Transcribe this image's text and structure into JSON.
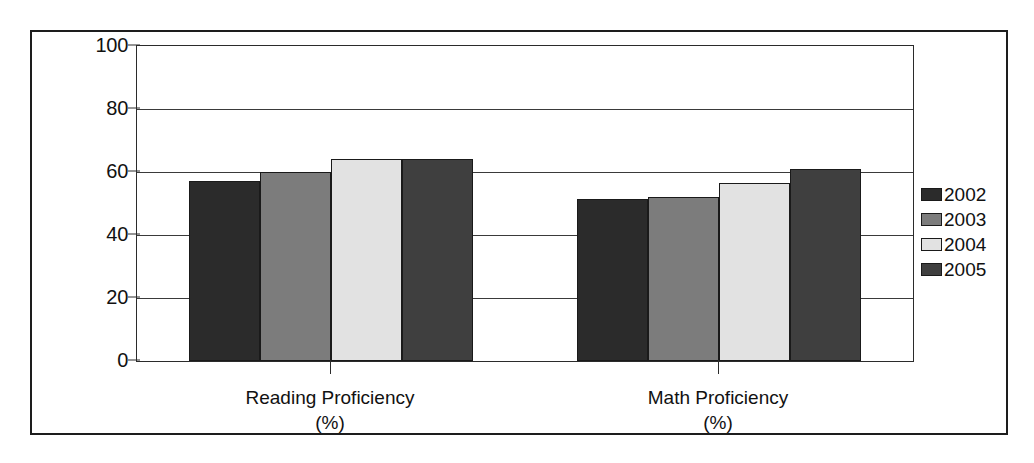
{
  "chart_data": {
    "type": "bar",
    "title": "",
    "subtitle": "",
    "xlabel": "",
    "ylabel": "",
    "ylim": [
      0,
      100
    ],
    "ytick_labels": [
      "100",
      "80",
      "60",
      "40",
      "20",
      "0"
    ],
    "ytick_values": [
      100,
      80,
      60,
      40,
      20,
      0
    ],
    "grid": true,
    "legend_position": "right",
    "categories": [
      "Reading Proficiency",
      "Math Proficiency"
    ],
    "category_units": [
      "(%)",
      "(%)"
    ],
    "series": [
      {
        "name": "2002",
        "color": "#2b2b2b",
        "values": [
          57,
          51.5
        ]
      },
      {
        "name": "2003",
        "color": "#7c7c7c",
        "values": [
          60,
          52
        ]
      },
      {
        "name": "2004",
        "color": "#e2e2e2",
        "values": [
          64,
          56.5
        ]
      },
      {
        "name": "2005",
        "color": "#3f3f3f",
        "values": [
          64,
          61
        ]
      }
    ]
  },
  "legend": {
    "entries": [
      {
        "label": "2002",
        "color": "#2b2b2b"
      },
      {
        "label": "2003",
        "color": "#7c7c7c"
      },
      {
        "label": "2004",
        "color": "#e2e2e2"
      },
      {
        "label": "2005",
        "color": "#3f3f3f"
      }
    ]
  },
  "axis": {
    "y_labels": [
      "100",
      "80",
      "60",
      "40",
      "20",
      "0"
    ]
  },
  "categories": [
    {
      "name": "Reading Proficiency",
      "unit": "(%)"
    },
    {
      "name": "Math Proficiency",
      "unit": "(%)"
    }
  ]
}
